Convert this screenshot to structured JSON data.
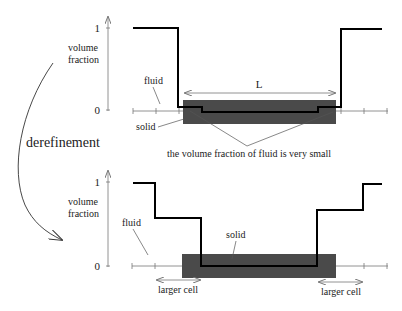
{
  "top_panel": {
    "y_axis": {
      "label_line1": "volume",
      "label_line2": "fraction",
      "tick_top": "1",
      "tick_bottom": "0"
    },
    "labels": {
      "fluid": "fluid",
      "solid": "solid",
      "length": "L",
      "note": "the volume fraction of fluid is very small"
    }
  },
  "transition": {
    "label": "derefinement"
  },
  "bottom_panel": {
    "y_axis": {
      "label_line1": "volume",
      "label_line2": "fraction",
      "tick_top": "1",
      "tick_bottom": "0"
    },
    "labels": {
      "fluid": "fluid",
      "solid": "solid",
      "larger_cell_left": "larger cell",
      "larger_cell_right": "larger cell"
    }
  },
  "colors": {
    "solid_fill": "#4a4a4a",
    "curve": "#000000",
    "axis": "#777777"
  }
}
